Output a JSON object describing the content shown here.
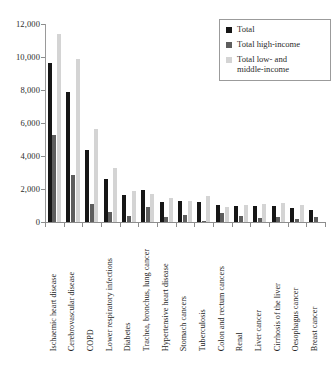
{
  "chart_data": {
    "type": "bar",
    "title": "",
    "subtitle": "",
    "xlabel": "",
    "ylabel": "",
    "ylim": [
      0,
      12000
    ],
    "y_ticks": [
      0,
      2000,
      4000,
      6000,
      8000,
      10000,
      12000
    ],
    "y_tick_labels": [
      "0",
      "2,000",
      "4,000",
      "6,000",
      "8,000",
      "10,000",
      "12,000"
    ],
    "grid": false,
    "legend_position": "top-right",
    "categories": [
      "Ischaemic heart disease",
      "Cerebrovascular disease",
      "COPD",
      "Lower respiratory infections",
      "Diabetes",
      "Trachea, bronchus, lung cancer",
      "Hypertensive heart disease",
      "Stomach cancers",
      "Tuberculosis",
      "Colon and rectum cancers",
      "Renal",
      "Liver cancer",
      "Cirrhosis of the liver",
      "Oesophagus cancer",
      "Breast cancer"
    ],
    "series": [
      {
        "name": "Total",
        "color": "#161616",
        "values": [
          9650,
          7850,
          4350,
          2620,
          1640,
          1960,
          1220,
          1280,
          1230,
          1060,
          960,
          960,
          960,
          870,
          720
        ]
      },
      {
        "name": "Total high-income",
        "color": "#5e5e5e",
        "values": [
          5300,
          2870,
          1090,
          600,
          390,
          920,
          320,
          420,
          90,
          560,
          360,
          270,
          330,
          200,
          330
        ]
      },
      {
        "name": "Total low- and middle-income",
        "color": "#d4d4d4",
        "values": [
          11400,
          9850,
          5650,
          3300,
          1880,
          1720,
          1460,
          1300,
          1560,
          900,
          1040,
          1120,
          1160,
          1030,
          0
        ]
      }
    ]
  },
  "legend": {
    "entries": [
      {
        "label": "Total",
        "swatch": "black-square-icon"
      },
      {
        "label": "Total high-income",
        "swatch": "dark-gray-square-icon"
      },
      {
        "label": "Total low- and\nmiddle-income",
        "swatch": "light-gray-square-icon"
      }
    ],
    "entry_0_label": "Total",
    "entry_1_label": "Total high-income",
    "entry_2_label_line1": "Total low- and",
    "entry_2_label_line2": "middle-income"
  },
  "caption": {
    "text": ""
  }
}
